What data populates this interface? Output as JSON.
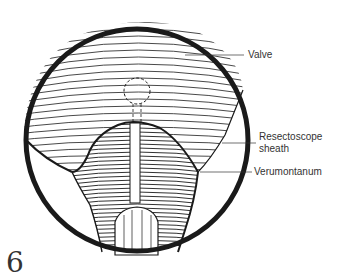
{
  "figure": {
    "number": "6",
    "labels": [
      {
        "id": "valve",
        "text": "Valve"
      },
      {
        "id": "sheath_line1",
        "text": "Resectoscope"
      },
      {
        "id": "sheath_line2",
        "text": "sheath"
      },
      {
        "id": "verumontanum",
        "text": "Verumontanum"
      }
    ]
  },
  "colors": {
    "ink": "#1a1a1a",
    "paper": "#ffffff",
    "label_text": "#333333"
  }
}
